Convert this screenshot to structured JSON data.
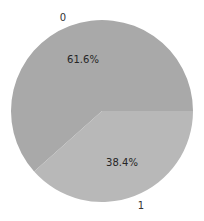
{
  "chart_data": {
    "type": "pie",
    "title": "",
    "labels": [
      "0",
      "1"
    ],
    "values": [
      61.6,
      38.4
    ],
    "value_labels": [
      "61.6%",
      "38.4%"
    ],
    "colors": [
      "#a9a9a9",
      "#b8b8b8"
    ],
    "start_angle": 0,
    "direction": "counterclockwise",
    "legend": "none"
  }
}
